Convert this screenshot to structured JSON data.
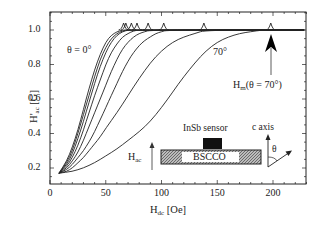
{
  "chart_data": {
    "type": "line",
    "title": "",
    "xlabel": "H_dc [Oe]",
    "ylabel": "H'_ac [G]",
    "xlim": [
      0,
      230
    ],
    "ylim": [
      0.14,
      1.1
    ],
    "xticks": [
      0,
      50,
      100,
      150,
      200
    ],
    "yticks": [
      0.2,
      0.4,
      0.6,
      0.8,
      1.0
    ],
    "xtick_labels": [
      "0",
      "50",
      "100",
      "150",
      "200"
    ],
    "ytick_labels": [
      "0.2",
      "0.4",
      "0.6",
      "0.8",
      "1.0"
    ],
    "grid": false,
    "legend": null,
    "series_note": "Family of curves for increasing angle θ from 0° (leftmost) to 70° (rightmost); each curve shows a small peak at H_m before saturating at 1.0",
    "series": [
      {
        "name": "θ = 0°",
        "x": [
          8,
          15,
          20,
          25,
          30,
          35,
          40,
          45,
          50,
          55,
          60,
          65,
          70
        ],
        "values": [
          0.17,
          0.24,
          0.32,
          0.42,
          0.54,
          0.66,
          0.77,
          0.86,
          0.93,
          0.97,
          0.99,
          1.0,
          1.0
        ],
        "peak_x": 66
      },
      {
        "name": "θ2",
        "x": [
          8,
          15,
          20,
          25,
          30,
          35,
          40,
          45,
          50,
          55,
          60,
          65,
          70
        ],
        "values": [
          0.17,
          0.23,
          0.3,
          0.4,
          0.51,
          0.62,
          0.73,
          0.83,
          0.9,
          0.95,
          0.98,
          0.995,
          1.0
        ],
        "peak_x": 68
      },
      {
        "name": "θ3",
        "x": [
          8,
          15,
          20,
          25,
          30,
          35,
          40,
          45,
          50,
          55,
          60,
          65,
          70,
          75
        ],
        "values": [
          0.17,
          0.22,
          0.28,
          0.37,
          0.47,
          0.58,
          0.69,
          0.79,
          0.87,
          0.93,
          0.97,
          0.99,
          1.0,
          1.0
        ],
        "peak_x": 73
      },
      {
        "name": "θ4",
        "x": [
          8,
          15,
          20,
          25,
          30,
          35,
          40,
          45,
          50,
          55,
          60,
          65,
          70,
          75,
          80
        ],
        "values": [
          0.17,
          0.21,
          0.26,
          0.33,
          0.42,
          0.52,
          0.62,
          0.71,
          0.8,
          0.87,
          0.92,
          0.96,
          0.98,
          0.995,
          1.0
        ],
        "peak_x": 78
      },
      {
        "name": "θ5",
        "x": [
          8,
          15,
          20,
          25,
          30,
          35,
          40,
          45,
          50,
          55,
          60,
          65,
          70,
          75,
          80,
          85,
          90
        ],
        "values": [
          0.17,
          0.2,
          0.24,
          0.29,
          0.36,
          0.44,
          0.52,
          0.6,
          0.68,
          0.76,
          0.83,
          0.89,
          0.93,
          0.96,
          0.98,
          0.99,
          1.0
        ],
        "peak_x": 88
      },
      {
        "name": "θ6",
        "x": [
          8,
          15,
          20,
          25,
          30,
          35,
          40,
          45,
          50,
          55,
          60,
          65,
          70,
          75,
          80,
          85,
          90,
          95,
          100,
          105
        ],
        "values": [
          0.17,
          0.19,
          0.22,
          0.26,
          0.3,
          0.35,
          0.41,
          0.48,
          0.55,
          0.62,
          0.69,
          0.76,
          0.82,
          0.87,
          0.91,
          0.94,
          0.96,
          0.98,
          0.99,
          1.0
        ],
        "peak_x": 102
      },
      {
        "name": "θ7",
        "x": [
          8,
          15,
          20,
          25,
          30,
          35,
          40,
          45,
          50,
          60,
          70,
          80,
          90,
          100,
          110,
          120,
          130,
          140
        ],
        "values": [
          0.17,
          0.18,
          0.2,
          0.23,
          0.26,
          0.3,
          0.34,
          0.38,
          0.43,
          0.52,
          0.62,
          0.72,
          0.81,
          0.88,
          0.93,
          0.96,
          0.98,
          1.0
        ],
        "peak_x": 138
      },
      {
        "name": "θ = 70°",
        "x": [
          8,
          20,
          30,
          40,
          50,
          60,
          70,
          80,
          90,
          100,
          110,
          120,
          130,
          140,
          150,
          160,
          170,
          180,
          190,
          200
        ],
        "values": [
          0.17,
          0.18,
          0.2,
          0.23,
          0.27,
          0.31,
          0.36,
          0.41,
          0.47,
          0.55,
          0.64,
          0.73,
          0.81,
          0.88,
          0.93,
          0.96,
          0.98,
          0.99,
          1.0,
          1.0
        ],
        "peak_x": 198
      }
    ],
    "annotations": [
      {
        "text": "θ = 0°",
        "x": 22,
        "y": 0.88
      },
      {
        "text": "70°",
        "x": 152,
        "y": 0.86
      },
      {
        "text": "H_m(θ = 70°)",
        "x": 165,
        "y": 0.59,
        "arrow_to": {
          "x": 198,
          "y": 0.97
        }
      },
      {
        "text": "InSb sensor",
        "type": "inset_label"
      },
      {
        "text": "BSCCO",
        "type": "inset_label"
      },
      {
        "text": "c axis",
        "type": "inset_label"
      },
      {
        "text": "θ",
        "type": "inset_label"
      },
      {
        "text": "H_ac",
        "type": "inset_label"
      }
    ]
  },
  "labels": {
    "xlabel_main": "H",
    "xlabel_sub": "dc",
    "xlabel_unit": " [Oe]",
    "ylabel_main": "H'",
    "ylabel_sub": "ac",
    "ylabel_unit": " [G]",
    "theta0": "θ = 0°",
    "theta70": "70°",
    "hm_main": "H",
    "hm_sub": "m",
    "hm_rest": "(θ = 70°)",
    "sensor": "InSb sensor",
    "sample": "BSCCO",
    "caxis": "c axis",
    "theta": "θ",
    "hac_main": "H",
    "hac_sub": "ac"
  }
}
